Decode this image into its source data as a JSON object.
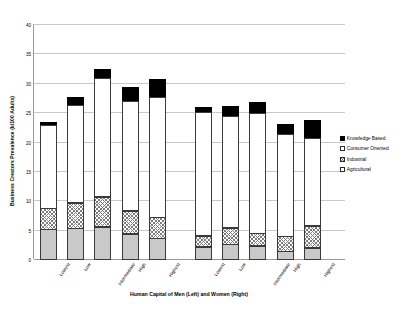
{
  "chart_data": {
    "type": "bar",
    "stacked": true,
    "title": "",
    "xlabel": "Human Capital of  Men (Left) and Women (Right)",
    "ylabel": "Business Creators Prevalence (k/100 Adults)",
    "ylim": [
      0,
      40
    ],
    "yticks": [
      0,
      5,
      10,
      15,
      20,
      25,
      30,
      35,
      40
    ],
    "grid": true,
    "legend_position": "right",
    "categories": [
      "Lowest",
      "Low",
      "Intermediate",
      "High",
      "Highest",
      "Lowest",
      "Low",
      "Intermediate",
      "High",
      "Highest"
    ],
    "groups": [
      {
        "name": "Men (Left)",
        "categories": [
          "Lowest",
          "Low",
          "Intermediate",
          "High",
          "Highest"
        ]
      },
      {
        "name": "Women (Right)",
        "categories": [
          "Lowest",
          "Low",
          "Intermediate",
          "High",
          "Highest"
        ]
      }
    ],
    "series": [
      {
        "name": "Agricultural",
        "values": [
          5.2,
          5.3,
          5.6,
          4.4,
          3.6,
          2.2,
          2.6,
          2.4,
          1.4,
          2.0
        ]
      },
      {
        "name": "Industrial",
        "values": [
          3.7,
          4.5,
          5.2,
          4.0,
          3.7,
          2.0,
          2.9,
          2.2,
          2.7,
          3.9
        ]
      },
      {
        "name": "Consumer Oriented",
        "values": [
          14.2,
          16.7,
          20.4,
          18.8,
          20.5,
          21.2,
          19.1,
          20.5,
          17.4,
          15.0
        ]
      },
      {
        "name": "Knowledge Based",
        "values": [
          0.6,
          1.4,
          1.6,
          2.5,
          3.2,
          0.9,
          1.8,
          2.0,
          1.9,
          3.2
        ]
      }
    ],
    "totals": [
      23.7,
      27.9,
      32.8,
      29.7,
      31.0,
      26.3,
      26.4,
      27.1,
      23.4,
      24.1
    ]
  },
  "legend": {
    "items": [
      {
        "label": "Knowledge Based",
        "pattern": "solid-black",
        "color": "#000000"
      },
      {
        "label": "Consumer Oriented",
        "pattern": "solid-white",
        "color": "#ffffff"
      },
      {
        "label": "Industrial",
        "pattern": "crosshatch",
        "color": "#7d7d7d"
      },
      {
        "label": "Agricultural",
        "pattern": "solid-gray",
        "color": "#c9c9c9"
      }
    ]
  },
  "axes": {
    "y_title": "Business Creators Prevalence (k/100 Adults)",
    "x_title": "Human Capital of  Men (Left) and Women (Right)",
    "y_tick_labels": [
      "0",
      "5",
      "10",
      "15",
      "20",
      "25",
      "30",
      "35",
      "40"
    ],
    "x_tick_labels": [
      "Lowest",
      "Low",
      "Intermediate",
      "High",
      "Highest",
      "Lowest",
      "Low",
      "Intermediate",
      "High",
      "Highest"
    ]
  }
}
